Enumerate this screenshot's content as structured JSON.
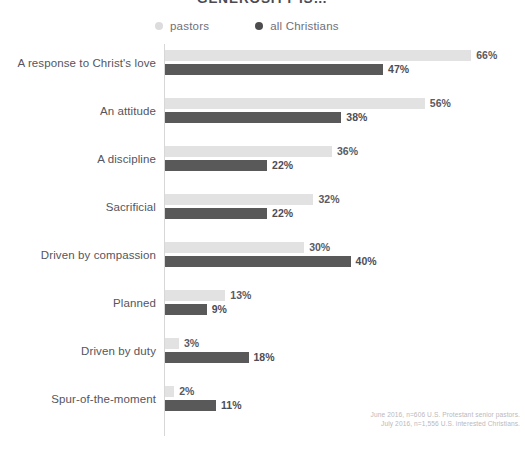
{
  "chart_data": {
    "type": "bar",
    "orientation": "horizontal",
    "title": "GENEROSITY IS…",
    "xlabel": "",
    "ylabel": "",
    "grid": false,
    "xlim": [
      0,
      70
    ],
    "legend_position": "top",
    "value_suffix": "%",
    "categories": [
      "A response to Christ's love",
      "An attitude",
      "A discipline",
      "Sacrificial",
      "Driven by compassion",
      "Planned",
      "Driven by duty",
      "Spur-of-the-moment"
    ],
    "series": [
      {
        "name": "pastors",
        "color": "#e2e2e2",
        "values": [
          66,
          56,
          36,
          32,
          30,
          13,
          3,
          2
        ],
        "labels": [
          "66%",
          "56%",
          "36%",
          "32%",
          "30%",
          "13%",
          "3%",
          "2%"
        ]
      },
      {
        "name": "all Christians",
        "color": "#595959",
        "values": [
          47,
          38,
          22,
          22,
          40,
          9,
          18,
          11
        ],
        "labels": [
          "47%",
          "38%",
          "22%",
          "22%",
          "40%",
          "9%",
          "18%",
          "11%"
        ]
      }
    ],
    "annotations": [
      "June 2016, n=606 U.S. Protestant senior pastors.",
      "July 2016, n=1,556 U.S. interested Christians."
    ]
  },
  "legend": {
    "entries": [
      {
        "label": "pastors",
        "swatch": "light-dot"
      },
      {
        "label": "all Christians",
        "swatch": "dark-dot"
      }
    ]
  },
  "source_note": {
    "line1": "June 2016, n=606 U.S. Protestant senior pastors.",
    "line2": "July 2016, n=1,556 U.S. interested Christians."
  },
  "colors": {
    "pastors": "#e2e2e2",
    "all_christians": "#595959",
    "axis": "#d7d7d7",
    "label_text": "#55555d",
    "value_text": "#4d4d55",
    "note_text": "#b9b9be"
  }
}
